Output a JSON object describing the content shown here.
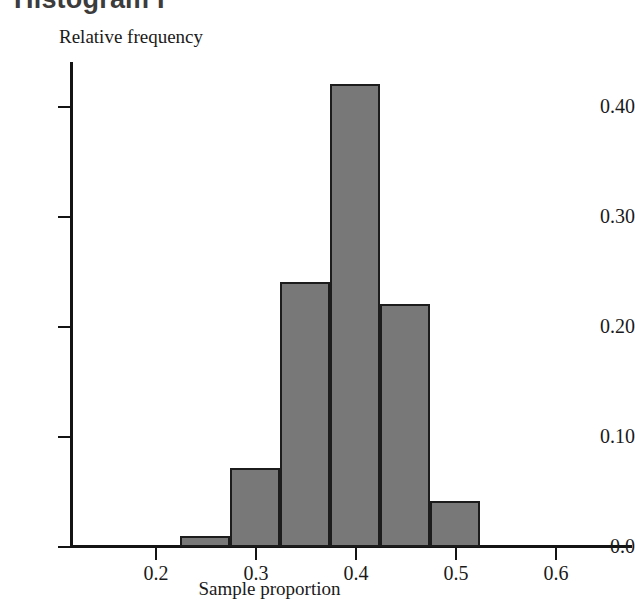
{
  "title": "Histogram I",
  "chart_data": {
    "type": "bar",
    "title": "Histogram I",
    "xlabel": "Sample proportion",
    "ylabel": "Relative frequency",
    "xlim": [
      0.15,
      0.665
    ],
    "ylim": [
      0.0,
      0.44
    ],
    "grid": false,
    "legend": null,
    "bin_width": 0.05,
    "bin_edges": [
      0.225,
      0.275,
      0.325,
      0.375,
      0.425,
      0.475,
      0.525
    ],
    "categories": [
      "0.225-0.275",
      "0.275-0.325",
      "0.325-0.375",
      "0.375-0.425",
      "0.425-0.475",
      "0.475-0.525"
    ],
    "values": [
      0.01,
      0.072,
      0.24,
      0.42,
      0.22,
      0.042
    ],
    "xticks": [
      "0.2",
      "0.3",
      "0.4",
      "0.5",
      "0.6"
    ],
    "xtick_values": [
      0.2,
      0.3,
      0.4,
      0.5,
      0.6
    ],
    "yticks": [
      "0.0",
      "0.10",
      "0.20",
      "0.30",
      "0.40"
    ],
    "ytick_values": [
      0.0,
      0.1,
      0.2,
      0.3,
      0.4
    ],
    "bar_color": "#787878",
    "bar_edge_color": "#1c1c1c",
    "axis_color": "#141414"
  },
  "axes": {
    "y_title": "Relative frequency",
    "x_title": "Sample proportion"
  },
  "yticks": [
    {
      "label": "0.40"
    },
    {
      "label": "0.30"
    },
    {
      "label": "0.20"
    },
    {
      "label": "0.10"
    },
    {
      "label": "0.0"
    }
  ],
  "xticks": [
    {
      "label": "0.2"
    },
    {
      "label": "0.3"
    },
    {
      "label": "0.4"
    },
    {
      "label": "0.5"
    },
    {
      "label": "0.6"
    }
  ]
}
